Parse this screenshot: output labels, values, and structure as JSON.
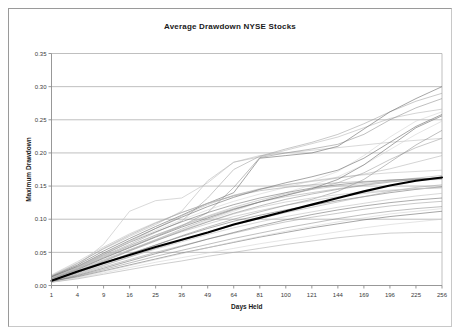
{
  "window": {
    "title": "Average Drawdown NYSE Stocks"
  },
  "colors": {
    "background": "#ffffff",
    "frame_border": "#9a9a9a",
    "gridline": "#aeaeae",
    "axis": "#8c8c8c",
    "tick_text": "#3a3a3a",
    "title_text": "#1a1a1a",
    "average_line": "#000000",
    "stock_line_light": "#c9c9c9",
    "stock_line_dark": "#6e6e6e"
  },
  "chart_data": {
    "type": "line",
    "title": "Average Drawdown NYSE Stocks",
    "xlabel": "Days Held",
    "ylabel": "Maximum Drawdown",
    "grid": true,
    "legend": "none",
    "x_axis_type": "category",
    "categories": [
      1,
      4,
      9,
      16,
      25,
      36,
      49,
      64,
      81,
      100,
      121,
      144,
      169,
      196,
      225,
      256
    ],
    "x_tick_labels": [
      "1",
      "4",
      "9",
      "16",
      "25",
      "36",
      "49",
      "64",
      "81",
      "100",
      "121",
      "144",
      "169",
      "196",
      "225",
      "256"
    ],
    "ylim": [
      0.0,
      0.35
    ],
    "y_ticks": [
      0.0,
      0.05,
      0.1,
      0.15,
      0.2,
      0.25,
      0.3,
      0.35
    ],
    "y_tick_labels": [
      "0.00",
      "0.05",
      "0.10",
      "0.15",
      "0.20",
      "0.25",
      "0.30",
      "0.35"
    ],
    "highlight_series": {
      "name": "Average",
      "emphasis": "bold-black",
      "values": [
        0.007,
        0.021,
        0.034,
        0.046,
        0.058,
        0.069,
        0.08,
        0.092,
        0.102,
        0.112,
        0.122,
        0.132,
        0.142,
        0.151,
        0.158,
        0.163
      ]
    },
    "series": [
      {
        "name": "Stock 1",
        "values": [
          0.013,
          0.03,
          0.062,
          0.112,
          0.128,
          0.132,
          0.155,
          0.186,
          0.196,
          0.2,
          0.204,
          0.208,
          0.212,
          0.216,
          0.219,
          0.222
        ]
      },
      {
        "name": "Stock 2",
        "values": [
          0.015,
          0.034,
          0.055,
          0.074,
          0.092,
          0.112,
          0.158,
          0.186,
          0.194,
          0.204,
          0.214,
          0.224,
          0.238,
          0.252,
          0.26,
          0.266
        ]
      },
      {
        "name": "Stock 3",
        "values": [
          0.012,
          0.027,
          0.045,
          0.062,
          0.08,
          0.097,
          0.132,
          0.175,
          0.195,
          0.206,
          0.216,
          0.228,
          0.244,
          0.262,
          0.278,
          0.29
        ]
      },
      {
        "name": "Stock 4",
        "values": [
          0.011,
          0.025,
          0.042,
          0.058,
          0.074,
          0.09,
          0.11,
          0.148,
          0.193,
          0.2,
          0.206,
          0.213,
          0.228,
          0.25,
          0.268,
          0.282
        ]
      },
      {
        "name": "Stock 5",
        "values": [
          0.014,
          0.031,
          0.052,
          0.071,
          0.089,
          0.106,
          0.124,
          0.14,
          0.192,
          0.196,
          0.2,
          0.21,
          0.236,
          0.262,
          0.282,
          0.3
        ]
      },
      {
        "name": "Stock 6",
        "values": [
          0.01,
          0.022,
          0.038,
          0.053,
          0.068,
          0.083,
          0.098,
          0.112,
          0.126,
          0.14,
          0.152,
          0.164,
          0.182,
          0.205,
          0.228,
          0.248
        ]
      },
      {
        "name": "Stock 7",
        "values": [
          0.012,
          0.026,
          0.044,
          0.06,
          0.076,
          0.09,
          0.104,
          0.116,
          0.126,
          0.134,
          0.14,
          0.146,
          0.152,
          0.158,
          0.162,
          0.166
        ]
      },
      {
        "name": "Stock 8",
        "values": [
          0.009,
          0.02,
          0.034,
          0.048,
          0.061,
          0.074,
          0.086,
          0.097,
          0.106,
          0.114,
          0.121,
          0.128,
          0.134,
          0.14,
          0.145,
          0.149
        ]
      },
      {
        "name": "Stock 9",
        "values": [
          0.008,
          0.018,
          0.031,
          0.043,
          0.055,
          0.066,
          0.077,
          0.087,
          0.096,
          0.104,
          0.111,
          0.118,
          0.124,
          0.13,
          0.135,
          0.139
        ]
      },
      {
        "name": "Stock 10",
        "values": [
          0.01,
          0.023,
          0.039,
          0.054,
          0.068,
          0.081,
          0.093,
          0.104,
          0.113,
          0.121,
          0.128,
          0.134,
          0.139,
          0.143,
          0.146,
          0.148
        ]
      },
      {
        "name": "Stock 11",
        "values": [
          0.007,
          0.016,
          0.028,
          0.039,
          0.05,
          0.06,
          0.07,
          0.079,
          0.088,
          0.096,
          0.103,
          0.109,
          0.115,
          0.12,
          0.124,
          0.127
        ]
      },
      {
        "name": "Stock 12",
        "values": [
          0.006,
          0.014,
          0.024,
          0.034,
          0.044,
          0.053,
          0.062,
          0.071,
          0.079,
          0.087,
          0.094,
          0.101,
          0.107,
          0.112,
          0.116,
          0.119
        ]
      },
      {
        "name": "Stock 13",
        "values": [
          0.006,
          0.013,
          0.022,
          0.031,
          0.04,
          0.049,
          0.057,
          0.065,
          0.073,
          0.08,
          0.087,
          0.093,
          0.099,
          0.104,
          0.108,
          0.112
        ]
      },
      {
        "name": "Stock 14",
        "values": [
          0.005,
          0.011,
          0.019,
          0.027,
          0.035,
          0.042,
          0.049,
          0.056,
          0.063,
          0.069,
          0.075,
          0.081,
          0.087,
          0.092,
          0.096,
          0.1
        ]
      },
      {
        "name": "Stock 15",
        "values": [
          0.005,
          0.01,
          0.017,
          0.024,
          0.031,
          0.037,
          0.044,
          0.05,
          0.056,
          0.062,
          0.067,
          0.072,
          0.076,
          0.079,
          0.08,
          0.08
        ]
      },
      {
        "name": "Stock 16",
        "values": [
          0.013,
          0.028,
          0.047,
          0.065,
          0.081,
          0.096,
          0.11,
          0.122,
          0.132,
          0.14,
          0.147,
          0.152,
          0.156,
          0.159,
          0.161,
          0.162
        ]
      },
      {
        "name": "Stock 17",
        "values": [
          0.016,
          0.036,
          0.058,
          0.078,
          0.095,
          0.11,
          0.124,
          0.136,
          0.145,
          0.152,
          0.158,
          0.163,
          0.167,
          0.17,
          0.172,
          0.174
        ]
      },
      {
        "name": "Stock 18",
        "values": [
          0.011,
          0.026,
          0.046,
          0.066,
          0.086,
          0.105,
          0.122,
          0.136,
          0.146,
          0.152,
          0.157,
          0.162,
          0.168,
          0.176,
          0.186,
          0.196
        ]
      },
      {
        "name": "Stock 19",
        "values": [
          0.009,
          0.021,
          0.037,
          0.053,
          0.069,
          0.085,
          0.1,
          0.114,
          0.126,
          0.136,
          0.145,
          0.155,
          0.17,
          0.19,
          0.208,
          0.222
        ]
      },
      {
        "name": "Stock 20",
        "values": [
          0.008,
          0.019,
          0.033,
          0.047,
          0.061,
          0.075,
          0.088,
          0.1,
          0.111,
          0.121,
          0.13,
          0.142,
          0.16,
          0.186,
          0.212,
          0.234
        ]
      },
      {
        "name": "Stock 21",
        "values": [
          0.01,
          0.024,
          0.041,
          0.057,
          0.073,
          0.088,
          0.102,
          0.115,
          0.126,
          0.136,
          0.146,
          0.16,
          0.182,
          0.21,
          0.238,
          0.256
        ]
      },
      {
        "name": "Stock 22",
        "values": [
          0.012,
          0.028,
          0.048,
          0.066,
          0.083,
          0.099,
          0.114,
          0.127,
          0.138,
          0.148,
          0.158,
          0.172,
          0.196,
          0.224,
          0.248,
          0.262
        ]
      },
      {
        "name": "Stock 23",
        "values": [
          0.007,
          0.017,
          0.03,
          0.043,
          0.056,
          0.068,
          0.08,
          0.091,
          0.101,
          0.11,
          0.118,
          0.126,
          0.134,
          0.142,
          0.148,
          0.152
        ]
      },
      {
        "name": "Stock 24",
        "values": [
          0.006,
          0.015,
          0.026,
          0.037,
          0.048,
          0.059,
          0.07,
          0.08,
          0.09,
          0.099,
          0.107,
          0.114,
          0.12,
          0.125,
          0.129,
          0.132
        ]
      },
      {
        "name": "Stock 25",
        "values": [
          0.009,
          0.022,
          0.038,
          0.054,
          0.069,
          0.083,
          0.096,
          0.108,
          0.118,
          0.126,
          0.132,
          0.137,
          0.141,
          0.144,
          0.146,
          0.147
        ]
      },
      {
        "name": "Stock 26",
        "values": [
          0.011,
          0.025,
          0.043,
          0.06,
          0.076,
          0.091,
          0.105,
          0.118,
          0.129,
          0.138,
          0.145,
          0.15,
          0.154,
          0.157,
          0.159,
          0.16
        ]
      },
      {
        "name": "Stock 27",
        "values": [
          0.014,
          0.033,
          0.056,
          0.076,
          0.094,
          0.11,
          0.124,
          0.135,
          0.143,
          0.148,
          0.152,
          0.155,
          0.157,
          0.159,
          0.16,
          0.161
        ]
      },
      {
        "name": "Stock 28",
        "values": [
          0.008,
          0.02,
          0.036,
          0.052,
          0.067,
          0.082,
          0.096,
          0.109,
          0.12,
          0.13,
          0.138,
          0.145,
          0.151,
          0.156,
          0.16,
          0.163
        ]
      },
      {
        "name": "Stock 29",
        "values": [
          0.013,
          0.029,
          0.049,
          0.068,
          0.086,
          0.103,
          0.119,
          0.133,
          0.145,
          0.155,
          0.164,
          0.174,
          0.192,
          0.216,
          0.24,
          0.258
        ]
      },
      {
        "name": "Stock 30",
        "values": [
          0.005,
          0.012,
          0.021,
          0.03,
          0.039,
          0.048,
          0.057,
          0.066,
          0.074,
          0.082,
          0.089,
          0.096,
          0.102,
          0.108,
          0.112,
          0.116
        ]
      }
    ]
  }
}
